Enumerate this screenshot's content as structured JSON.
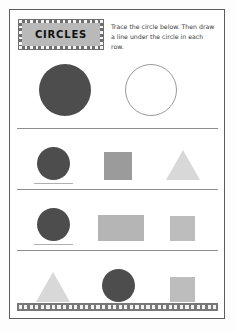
{
  "worksheet": {
    "title": "CIRCLES",
    "instructions": "Trace the circle below. Then draw a line under the circle in each row.",
    "shape_focus": "circle"
  },
  "colors": {
    "circle_dark": "#4d4d4d",
    "circle_outline_stroke": "#9a9a9a",
    "square_mid": "#9b9b9b",
    "square_light": "#bdbdbd",
    "rect_light": "#b5b5b5",
    "triangle_light": "#d8d8d8",
    "banner_bg": "#6e6e6e",
    "banner_inner": "#b9b9b9",
    "page_border": "#5c5c5c",
    "divider": "#8e8e8e",
    "answer_line": "#b0b0b0",
    "footer_band": "#787878"
  },
  "rows": [
    {
      "name": "example-row",
      "cells": [
        {
          "shape": "circle",
          "fill": "solid",
          "tone": "dark",
          "answer_line": false
        },
        {
          "shape": "circle",
          "fill": "outline",
          "tone": "trace",
          "answer_line": false
        }
      ]
    },
    {
      "name": "practice-row-1",
      "cells": [
        {
          "shape": "circle",
          "fill": "solid",
          "tone": "dark",
          "answer_line": true
        },
        {
          "shape": "square",
          "fill": "solid",
          "tone": "mid",
          "answer_line": false
        },
        {
          "shape": "triangle",
          "fill": "solid",
          "tone": "light",
          "answer_line": false
        }
      ]
    },
    {
      "name": "practice-row-2",
      "cells": [
        {
          "shape": "circle",
          "fill": "solid",
          "tone": "dark",
          "answer_line": true
        },
        {
          "shape": "rectangle",
          "fill": "solid",
          "tone": "light",
          "answer_line": false
        },
        {
          "shape": "square",
          "fill": "solid",
          "tone": "light",
          "answer_line": false
        }
      ]
    },
    {
      "name": "practice-row-3",
      "cells": [
        {
          "shape": "triangle",
          "fill": "solid",
          "tone": "light",
          "answer_line": false
        },
        {
          "shape": "circle",
          "fill": "solid",
          "tone": "dark",
          "answer_line": true
        },
        {
          "shape": "square",
          "fill": "solid",
          "tone": "light",
          "answer_line": false
        }
      ]
    }
  ]
}
